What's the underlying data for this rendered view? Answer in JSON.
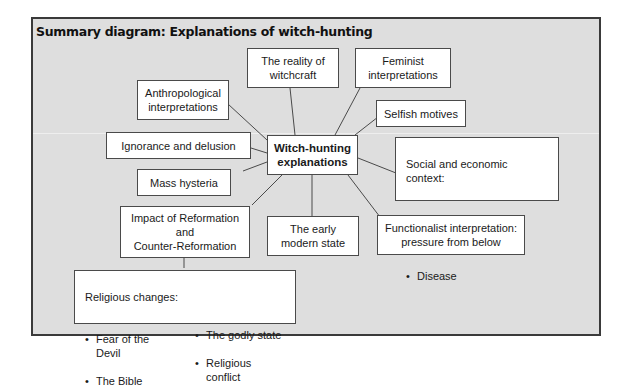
{
  "title": "Summary diagram: Explanations of witch-hunting",
  "center": "Witch-hunting\nexplanations",
  "nodes": {
    "reality": "The reality of\nwitchcraft",
    "feminist": "Feminist\ninterpretations",
    "anthropological": "Anthropological\ninterpretations",
    "selfish": "Selfish motives",
    "ignorance": "Ignorance and delusion",
    "mass_hysteria": "Mass hysteria",
    "reformation": "Impact of Reformation\nand\nCounter-Reformation",
    "early_modern_state": "The early\nmodern state",
    "functionalist": "Functionalist interpretation:\npressure from below",
    "social_economic": {
      "heading": "Social and economic context:",
      "items": [
        "Class conflict",
        "‘Mini ice age’",
        "Disease"
      ]
    },
    "religious": {
      "heading": "Religious changes:",
      "col1": [
        "Fear of the Devil",
        "The Bible"
      ],
      "col2": [
        "The godly state",
        "Religious conflict"
      ]
    }
  },
  "colors": {
    "frame_bg": "#dedede",
    "frame_border": "#3a3a3a",
    "box_bg": "#ffffff",
    "line": "#4a4a4a"
  }
}
